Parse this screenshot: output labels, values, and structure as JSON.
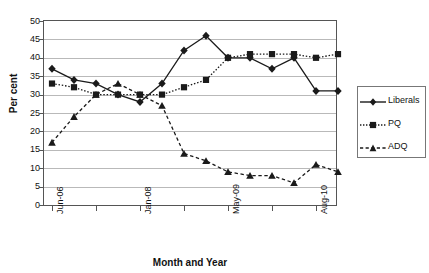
{
  "chart_data": {
    "type": "line",
    "title": "",
    "xlabel": "Month and Year",
    "ylabel": "Per cent",
    "ylim": [
      0,
      50
    ],
    "ytick_step": 5,
    "yticks": [
      0,
      5,
      10,
      15,
      20,
      25,
      30,
      35,
      40,
      45,
      50
    ],
    "grid": true,
    "legend_position": "right-outside",
    "x_count": 14,
    "x_tick_indices": [
      0,
      4,
      8,
      12
    ],
    "x_tick_labels": [
      "Jun-06",
      "Jan-08",
      "May-09",
      "Aug-10"
    ],
    "categories": [
      "Jun-06",
      "",
      "",
      "",
      "Jan-08",
      "",
      "",
      "",
      "May-09",
      "",
      "",
      "",
      "Aug-10",
      ""
    ],
    "series": [
      {
        "name": "Liberals",
        "marker": "diamond",
        "line_style": "solid",
        "color": "#1a1a1a",
        "values": [
          37,
          34,
          33,
          30,
          28,
          33,
          42,
          46,
          40,
          40,
          37,
          40,
          31,
          31
        ]
      },
      {
        "name": "PQ",
        "marker": "square",
        "line_style": "dotted",
        "color": "#1a1a1a",
        "values": [
          33,
          32,
          30,
          30,
          30,
          30,
          32,
          34,
          40,
          41,
          41,
          41,
          40,
          41
        ]
      },
      {
        "name": "ADQ",
        "marker": "triangle",
        "line_style": "dashed",
        "color": "#1a1a1a",
        "values": [
          17,
          24,
          30,
          33,
          30,
          27,
          14,
          12,
          9,
          8,
          8,
          6,
          11,
          9
        ]
      }
    ]
  },
  "legend": {
    "items": [
      {
        "label": "Liberals"
      },
      {
        "label": "PQ"
      },
      {
        "label": "ADQ"
      }
    ]
  }
}
